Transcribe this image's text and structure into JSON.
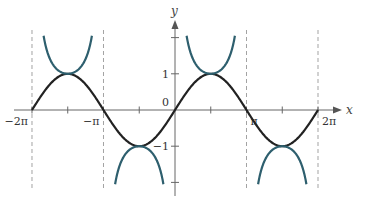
{
  "chart_data": {
    "type": "line",
    "title": "",
    "xlabel": "x",
    "ylabel": "y",
    "xlim": [
      -6.6,
      6.6
    ],
    "ylim": [
      -2.4,
      2.4
    ],
    "grid": false,
    "x_ticks": [
      {
        "value": -6.2832,
        "label": "−2π"
      },
      {
        "value": -4.7124,
        "label": ""
      },
      {
        "value": -3.1416,
        "label": "−π"
      },
      {
        "value": -1.5708,
        "label": ""
      },
      {
        "value": 1.5708,
        "label": ""
      },
      {
        "value": 3.1416,
        "label": "π"
      },
      {
        "value": 4.7124,
        "label": ""
      },
      {
        "value": 6.2832,
        "label": "2π"
      }
    ],
    "y_ticks": [
      {
        "value": 2,
        "label": ""
      },
      {
        "value": 1,
        "label": "1"
      },
      {
        "value": 0,
        "label": "0"
      },
      {
        "value": -1,
        "label": "−1"
      },
      {
        "value": -2,
        "label": ""
      }
    ],
    "asymptotes_x": [
      -6.2832,
      -3.1416,
      3.1416,
      6.2832
    ],
    "series": [
      {
        "name": "y = sin x",
        "color": "#222222",
        "function": "sin",
        "domain": [
          -6.2832,
          6.2832
        ]
      },
      {
        "name": "y = csc x",
        "color": "#2e5f6e",
        "function": "csc",
        "domain": [
          -6.2832,
          6.2832
        ],
        "clip_abs": 2.05
      }
    ]
  }
}
